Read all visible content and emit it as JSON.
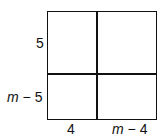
{
  "diagram": {
    "type": "area-model-square",
    "left_labels": [
      {
        "text": "5"
      },
      {
        "var": "m",
        "rest": " − 5"
      }
    ],
    "bottom_labels": [
      {
        "text": "4"
      },
      {
        "var": "m",
        "rest": " − 4"
      }
    ]
  }
}
